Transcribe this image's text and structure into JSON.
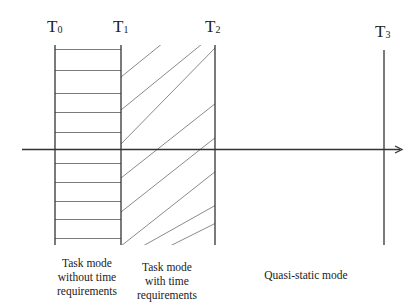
{
  "diagram": {
    "type": "timeline-modes",
    "axis": {
      "x_start": 22,
      "x_end": 402,
      "y": 149,
      "arrow": true,
      "color": "#333333"
    },
    "time_markers": [
      {
        "id": "T0",
        "label": "T",
        "subscript": "0",
        "x": 55
      },
      {
        "id": "T1",
        "label": "T",
        "subscript": "1",
        "x": 121
      },
      {
        "id": "T2",
        "label": "T",
        "subscript": "2",
        "x": 215
      },
      {
        "id": "T3",
        "label": "T",
        "subscript": "3",
        "x": 384
      }
    ],
    "regions": [
      {
        "id": "task-without-time",
        "from": "T0",
        "to": "T1",
        "fill": "horizontal-lines",
        "label_lines": [
          "Task mode",
          "without time",
          "requirements"
        ]
      },
      {
        "id": "task-with-time",
        "from": "T1",
        "to": "T2",
        "fill": "diagonal-hatch",
        "label_lines": [
          "Task mode",
          "with time",
          "requirements"
        ]
      },
      {
        "id": "quasi-static",
        "from": "T2",
        "to": "T3",
        "fill": "none",
        "label_lines": [
          "Quasi-static mode"
        ]
      }
    ],
    "colors": {
      "line": "#333333",
      "hatch": "#8a8a8a",
      "background": "#ffffff"
    }
  }
}
